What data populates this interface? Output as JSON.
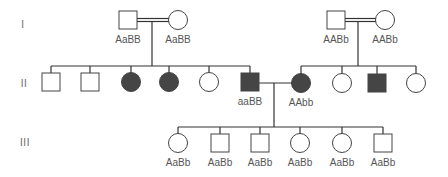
{
  "colors": {
    "line": "#333333",
    "affected": "#454545",
    "unaffected": "#ffffff",
    "text": "#555555"
  },
  "generations": [
    {
      "label": "I",
      "x": 23,
      "y": 24
    },
    {
      "label": "II",
      "x": 24,
      "y": 83
    },
    {
      "label": "III",
      "x": 25,
      "y": 142
    }
  ],
  "individuals": [
    {
      "id": "I-1",
      "sex": "male",
      "affected": false,
      "x": 128,
      "y": 20,
      "genotype": "AaBB"
    },
    {
      "id": "I-2",
      "sex": "female",
      "affected": false,
      "x": 178,
      "y": 20,
      "genotype": "AaBB"
    },
    {
      "id": "I-3",
      "sex": "male",
      "affected": false,
      "x": 336,
      "y": 20,
      "genotype": "AABb"
    },
    {
      "id": "I-4",
      "sex": "female",
      "affected": false,
      "x": 385,
      "y": 20,
      "genotype": "AABb"
    },
    {
      "id": "II-1",
      "sex": "male",
      "affected": false,
      "x": 51,
      "y": 82,
      "genotype": ""
    },
    {
      "id": "II-2",
      "sex": "male",
      "affected": false,
      "x": 90,
      "y": 82,
      "genotype": ""
    },
    {
      "id": "II-3",
      "sex": "female",
      "affected": true,
      "x": 131,
      "y": 82,
      "genotype": ""
    },
    {
      "id": "II-4",
      "sex": "female",
      "affected": true,
      "x": 169,
      "y": 82,
      "genotype": ""
    },
    {
      "id": "II-5",
      "sex": "female",
      "affected": false,
      "x": 209,
      "y": 82,
      "genotype": ""
    },
    {
      "id": "II-6",
      "sex": "male",
      "affected": true,
      "x": 250,
      "y": 82,
      "genotype": "aaBB"
    },
    {
      "id": "II-7",
      "sex": "female",
      "affected": true,
      "x": 301,
      "y": 83,
      "genotype": "AAbb"
    },
    {
      "id": "II-8",
      "sex": "female",
      "affected": false,
      "x": 342,
      "y": 83,
      "genotype": ""
    },
    {
      "id": "II-9",
      "sex": "male",
      "affected": true,
      "x": 377,
      "y": 83,
      "genotype": ""
    },
    {
      "id": "II-10",
      "sex": "female",
      "affected": false,
      "x": 416,
      "y": 83,
      "genotype": ""
    },
    {
      "id": "III-1",
      "sex": "female",
      "affected": false,
      "x": 178,
      "y": 143,
      "genotype": "AaBb"
    },
    {
      "id": "III-2",
      "sex": "male",
      "affected": false,
      "x": 220,
      "y": 143,
      "genotype": "AaBb"
    },
    {
      "id": "III-3",
      "sex": "male",
      "affected": false,
      "x": 260,
      "y": 143,
      "genotype": "AaBb"
    },
    {
      "id": "III-4",
      "sex": "female",
      "affected": false,
      "x": 300,
      "y": 143,
      "genotype": "AaBb"
    },
    {
      "id": "III-5",
      "sex": "female",
      "affected": false,
      "x": 342,
      "y": 143,
      "genotype": "AaBb"
    },
    {
      "id": "III-6",
      "sex": "male",
      "affected": false,
      "x": 383,
      "y": 143,
      "genotype": "AaBb"
    }
  ]
}
